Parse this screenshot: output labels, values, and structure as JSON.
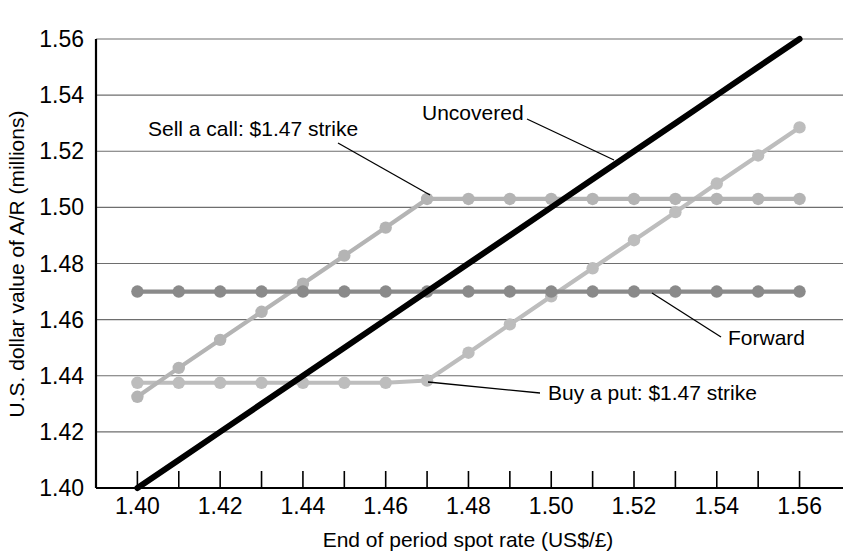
{
  "chart_data": {
    "type": "line",
    "title": "",
    "xlabel": "End of period spot rate (US$/£)",
    "ylabel": "U.S. dollar value of A/R (millions)",
    "xlim": [
      1.39,
      1.5705
    ],
    "ylim": [
      1.4,
      1.56
    ],
    "x_tick_step": 0.01,
    "x_label_step": 0.02,
    "y_tick_step": 0.02,
    "grid": "horizontal",
    "legend": "annotations",
    "x": [
      1.4,
      1.41,
      1.42,
      1.43,
      1.44,
      1.45,
      1.46,
      1.47,
      1.48,
      1.49,
      1.5,
      1.51,
      1.52,
      1.53,
      1.54,
      1.55,
      1.56
    ],
    "x_tick_labels": [
      "1.40",
      "1.42",
      "1.44",
      "1.46",
      "1.48",
      "1.50",
      "1.52",
      "1.54",
      "1.56"
    ],
    "y_tick_labels": [
      "1.40",
      "1.42",
      "1.44",
      "1.46",
      "1.48",
      "1.50",
      "1.52",
      "1.54",
      "1.56"
    ],
    "y_tick_values": [
      1.4,
      1.42,
      1.44,
      1.46,
      1.48,
      1.5,
      1.52,
      1.54,
      1.56
    ],
    "series": [
      {
        "name": "Uncovered",
        "color": "#000000",
        "width": 6.0,
        "markers": false,
        "values": [
          1.4,
          1.41,
          1.42,
          1.43,
          1.44,
          1.45,
          1.46,
          1.47,
          1.48,
          1.49,
          1.5,
          1.51,
          1.52,
          1.53,
          1.54,
          1.55,
          1.56
        ]
      },
      {
        "name": "Forward",
        "color": "#8a8a8a",
        "width": 4.2,
        "markers": true,
        "marker_radius": 6.2,
        "values": [
          1.47,
          1.47,
          1.47,
          1.47,
          1.47,
          1.47,
          1.47,
          1.47,
          1.47,
          1.47,
          1.47,
          1.47,
          1.47,
          1.47,
          1.47,
          1.47,
          1.47
        ]
      },
      {
        "name": "Sell a call: $1.47 strike",
        "color": "#b4b4b4",
        "width": 4.2,
        "markers": true,
        "marker_radius": 6.2,
        "values": [
          1.4325,
          1.4428,
          1.4528,
          1.4628,
          1.4728,
          1.4828,
          1.4928,
          1.503,
          1.503,
          1.503,
          1.503,
          1.503,
          1.503,
          1.503,
          1.503,
          1.503,
          1.503
        ]
      },
      {
        "name": "Buy a put: $1.47 strike",
        "color": "#bdbdbd",
        "width": 4.2,
        "markers": true,
        "marker_radius": 6.2,
        "values": [
          1.4375,
          1.4375,
          1.4375,
          1.4375,
          1.4375,
          1.4375,
          1.4375,
          1.4383,
          1.4482,
          1.4583,
          1.4683,
          1.4783,
          1.4883,
          1.4983,
          1.5085,
          1.5185,
          1.5285
        ]
      }
    ],
    "annotations": [
      {
        "name": "sell-a-call",
        "text": "Sell a call: $1.47 strike",
        "text_x": 148,
        "text_y": 136,
        "anchor": "start",
        "leader": [
          [
            338,
            143
          ],
          [
            430,
            195
          ]
        ]
      },
      {
        "name": "uncovered",
        "text": "Uncovered",
        "text_x": 422,
        "text_y": 120,
        "anchor": "start",
        "leader": [
          [
            527,
            119
          ],
          [
            614,
            160
          ]
        ]
      },
      {
        "name": "forward",
        "text": "Forward",
        "text_x": 728,
        "text_y": 345,
        "anchor": "start",
        "leader": [
          [
            721,
            337
          ],
          [
            652,
            293
          ]
        ]
      },
      {
        "name": "buy-a-put",
        "text": "Buy a put: $1.47 strike",
        "text_x": 548,
        "text_y": 400,
        "anchor": "start",
        "leader": [
          [
            540,
            393
          ],
          [
            428,
            382
          ]
        ]
      }
    ]
  },
  "plot_geometry": {
    "left_px": 96,
    "right_px": 843,
    "top_px": 39,
    "bottom_px": 488,
    "x_min": 1.39,
    "x_max": 1.5705,
    "y_min": 1.4,
    "y_max": 1.56
  }
}
